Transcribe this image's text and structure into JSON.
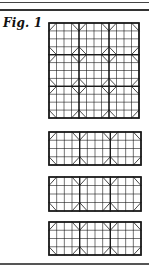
{
  "figure": {
    "label": "Fig. 1",
    "main_grid": {
      "x": 49,
      "y": 23,
      "width": 90,
      "height": 95,
      "block_cols": 3,
      "block_rows": 3,
      "subdivisions": 4
    },
    "strips": [
      {
        "x": 49,
        "y": 132,
        "width": 92,
        "height": 33,
        "block_cols": 3,
        "block_rows": 1,
        "subdivisions": 4
      },
      {
        "x": 49,
        "y": 177,
        "width": 92,
        "height": 34,
        "block_cols": 3,
        "block_rows": 1,
        "subdivisions": 4
      },
      {
        "x": 49,
        "y": 222,
        "width": 92,
        "height": 33,
        "block_cols": 3,
        "block_rows": 1,
        "subdivisions": 4
      }
    ],
    "colors": {
      "ink": "#1a1a1a",
      "background": "#ffffff"
    }
  }
}
